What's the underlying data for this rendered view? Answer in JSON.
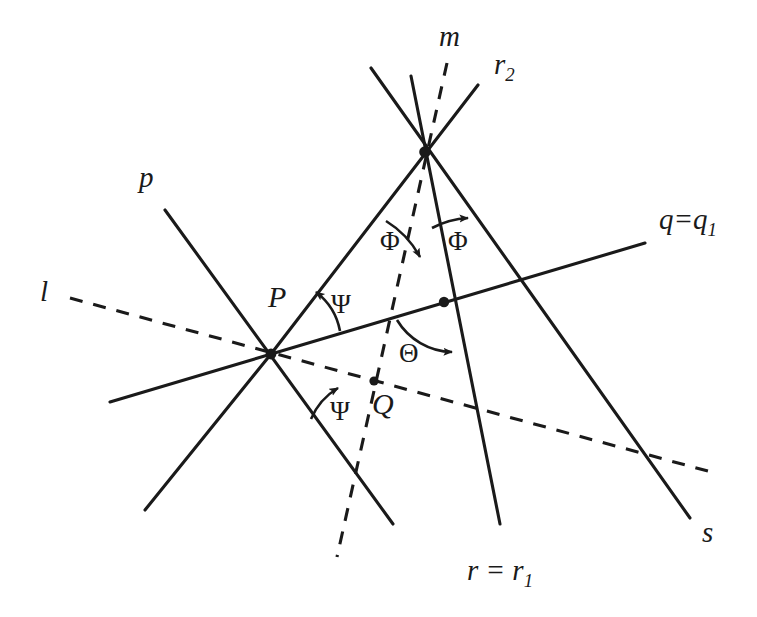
{
  "figure": {
    "kind": "geometry-diagram",
    "background_color": "#ffffff",
    "stroke_color": "#1a1a1a"
  },
  "labels": {
    "line_m": "m",
    "line_r2": "r",
    "line_r2_sub": "2",
    "line_p": "p",
    "line_l": "l",
    "line_q": "q=q",
    "line_q_sub": "1",
    "line_s": "s",
    "line_r": "r = r",
    "line_r_sub": "1",
    "point_P": "P",
    "point_Q": "Q",
    "angle_phi_left": "Φ",
    "angle_phi_right": "Φ",
    "angle_psi_upper": "Ψ",
    "angle_psi_lower": "Ψ",
    "angle_theta": "Θ"
  },
  "geometry": {
    "vertices": {
      "P": {
        "x": 271,
        "y": 354
      },
      "T": {
        "x": 425,
        "y": 152
      },
      "Q": {
        "x": 374,
        "y": 381
      },
      "M": {
        "x": 444,
        "y": 302
      }
    },
    "lines": [
      {
        "name": "p",
        "style": "solid",
        "x1": 165,
        "y1": 210,
        "x2": 393,
        "y2": 524
      },
      {
        "name": "q",
        "style": "solid",
        "x1": 110,
        "y1": 402,
        "x2": 645,
        "y2": 243
      },
      {
        "name": "l",
        "style": "dashed",
        "x1": 70,
        "y1": 298,
        "x2": 715,
        "y2": 473
      },
      {
        "name": "m",
        "style": "dashed",
        "x1": 447,
        "y1": 63,
        "x2": 337,
        "y2": 557
      },
      {
        "name": "r",
        "style": "solid",
        "x1": 411,
        "y1": 76,
        "x2": 500,
        "y2": 524
      },
      {
        "name": "r2",
        "style": "solid",
        "x1": 478,
        "y1": 85,
        "x2": 271,
        "y2": 354
      },
      {
        "name": "s",
        "style": "solid",
        "x1": 371,
        "y1": 68,
        "x2": 690,
        "y2": 518
      },
      {
        "name": "p_lower_left",
        "style": "solid",
        "x1": 271,
        "y1": 354,
        "x2": 145,
        "y2": 510
      }
    ]
  }
}
